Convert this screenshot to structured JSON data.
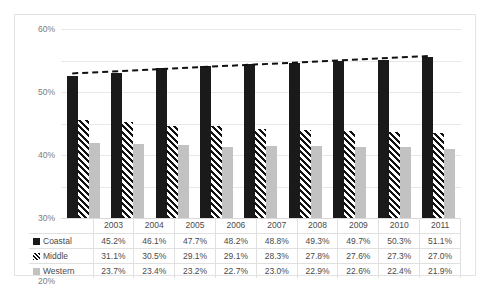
{
  "chart_data": {
    "type": "bar",
    "title": "",
    "xlabel": "",
    "ylabel": "",
    "categories": [
      "2003",
      "2004",
      "2005",
      "2006",
      "2007",
      "2008",
      "2009",
      "2010",
      "2011"
    ],
    "series": [
      {
        "name": "Coastal",
        "marker": "solid-black-square",
        "color": "#1a1a1a",
        "values": [
          45.2,
          46.1,
          47.7,
          48.2,
          48.8,
          49.3,
          49.7,
          50.3,
          51.1
        ],
        "labels": [
          "45.2%",
          "46.1%",
          "47.7%",
          "48.2%",
          "48.8%",
          "49.3%",
          "49.7%",
          "50.3%",
          "51.1%"
        ]
      },
      {
        "name": "Middle",
        "marker": "diagonal-striped-square",
        "color": "#121212",
        "values": [
          31.1,
          30.5,
          29.1,
          29.1,
          28.3,
          27.8,
          27.6,
          27.3,
          27.0
        ],
        "labels": [
          "31.1%",
          "30.5%",
          "29.1%",
          "29.1%",
          "28.3%",
          "27.8%",
          "27.6%",
          "27.3%",
          "27.0%"
        ]
      },
      {
        "name": "Western",
        "marker": "light-gray-square",
        "color": "#c2c2c2",
        "values": [
          23.7,
          23.4,
          23.2,
          22.7,
          23.0,
          22.9,
          22.6,
          22.4,
          21.9
        ],
        "labels": [
          "23.7%",
          "23.4%",
          "23.2%",
          "22.7%",
          "23.0%",
          "22.9%",
          "22.6%",
          "22.4%",
          "21.9%"
        ]
      }
    ],
    "trendline": {
      "name": "Coastal trendline",
      "style": "dashed",
      "color": "#111111",
      "start_value": 45.9,
      "end_value": 51.4
    },
    "ylim": [
      0,
      60
    ],
    "yticks": [
      0,
      10,
      20,
      30,
      40,
      50,
      60
    ],
    "ytick_labels": [
      "0%",
      "10%",
      "20%",
      "30%",
      "40%",
      "50%",
      "60%"
    ],
    "grid": true,
    "legend_position": "table-left-column",
    "table": {
      "row_headers": [
        "Coastal",
        "Middle",
        "Western"
      ]
    }
  }
}
